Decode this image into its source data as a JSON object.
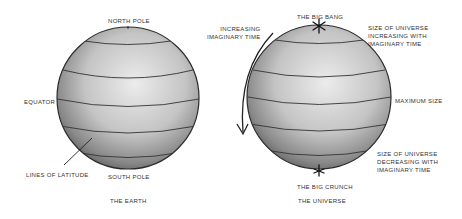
{
  "earth": {
    "north_pole": "NORTH POLE",
    "equator": "EQUATOR",
    "lines_of_latitude": "LINES OF LATITUDE",
    "south_pole": "SOUTH POLE",
    "caption": "THE EARTH"
  },
  "universe": {
    "increasing_time": "INCREASING\nIMAGINARY TIME",
    "big_bang": "THE BIG BANG",
    "size_increasing": "SIZE OF UNIVERSE\nINCREASING WITH\nIMAGINARY TIME",
    "maximum_size": "MAXIMUM SIZE",
    "size_decreasing": "SIZE OF UNIVERSE\nDECREASING WITH\nIMAGINARY TIME",
    "big_crunch": "THE BIG CRUNCH",
    "caption": "THE UNIVERSE"
  },
  "colors": {
    "outline": "#2b2b2b",
    "sphere_light": "#e6e6e6",
    "sphere_dark": "#6e6e6e"
  }
}
